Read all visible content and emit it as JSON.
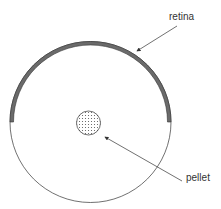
{
  "diagram": {
    "labels": {
      "retina": "retina",
      "pellet": "pellet"
    },
    "colors": {
      "outline": "#333333",
      "retina_fill": "#6b6b6b",
      "pellet_dots": "#555555",
      "background": "#ffffff"
    }
  }
}
